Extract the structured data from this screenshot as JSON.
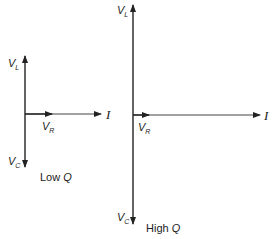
{
  "diagrams": [
    {
      "name": "low-q",
      "caption_prefix": "Low ",
      "caption_var": "Q",
      "labels": {
        "vl": "V",
        "vl_sub": "L",
        "vr": "V",
        "vr_sub": "R",
        "vc": "V",
        "vc_sub": "C",
        "i": "I"
      }
    },
    {
      "name": "high-q",
      "caption_prefix": "High ",
      "caption_var": "Q",
      "labels": {
        "vl": "V",
        "vl_sub": "L",
        "vr": "V",
        "vr_sub": "R",
        "vc": "V",
        "vc_sub": "C",
        "i": "I"
      }
    }
  ],
  "colors": {
    "line": "#222222",
    "background": "#ffffff"
  }
}
